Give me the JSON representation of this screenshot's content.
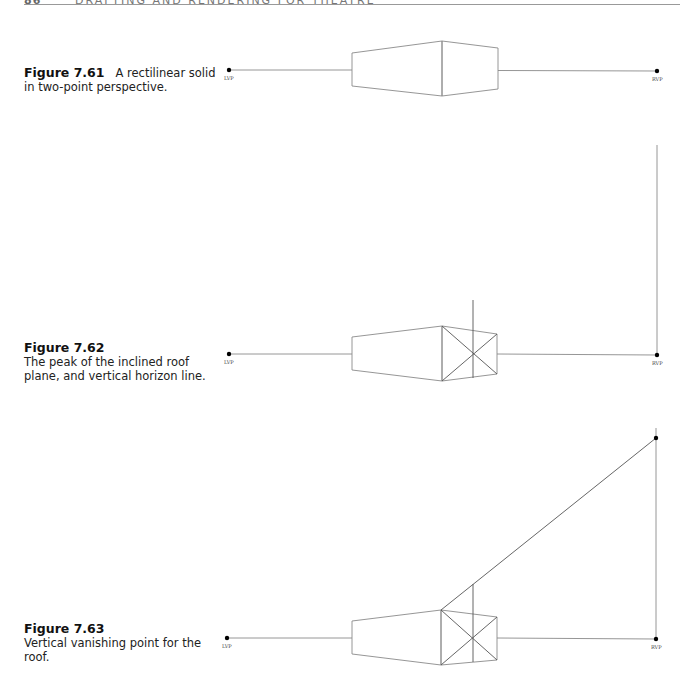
{
  "header": {
    "page_number": "86",
    "running_title": "DRAFTING AND RENDERING FOR THEATRE"
  },
  "figures": [
    {
      "label": "Figure 7.61",
      "caption": "A rectilinear solid in two-point perspective.",
      "lvp_label": "LVP",
      "rvp_label": "RVP"
    },
    {
      "label": "Figure 7.62",
      "caption": "The peak of the inclined roof plane, and vertical horizon line.",
      "lvp_label": "LVP",
      "rvp_label": "RVP"
    },
    {
      "label": "Figure 7.63",
      "caption": "Vertical vanishing point for the roof.",
      "lvp_label": "LVP",
      "rvp_label": "RVP"
    }
  ],
  "colors": {
    "line": "#8a8a8a",
    "dark_line": "#555555",
    "dot": "#000000"
  }
}
